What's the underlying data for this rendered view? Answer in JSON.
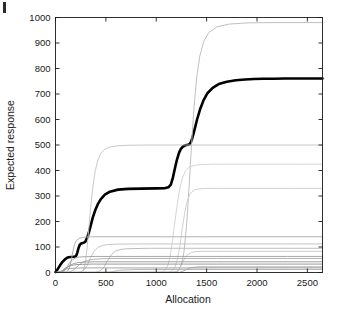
{
  "chart_data": {
    "type": "line",
    "title": "",
    "xlabel": "Allocation",
    "ylabel": "Expected response",
    "xlim": [
      0,
      2650
    ],
    "ylim": [
      0,
      1000
    ],
    "xticks": [
      0,
      500,
      1000,
      1500,
      2000,
      2500
    ],
    "yticks": [
      0,
      100,
      200,
      300,
      400,
      500,
      600,
      700,
      800,
      900,
      1000
    ],
    "xtick_labels": [
      "0",
      "500",
      "1000",
      "1500",
      "2000",
      "2500"
    ],
    "ytick_labels": [
      "0",
      "100",
      "200",
      "300",
      "400",
      "500",
      "600",
      "700",
      "800",
      "900",
      "1000"
    ],
    "grid": false,
    "legend": null,
    "series": [
      {
        "name": "total-expected-response",
        "emphasis": "thick-black",
        "color": "#000000",
        "width": 2.6,
        "plateaus": [
          60,
          115,
          330,
          500,
          760
        ],
        "x": [
          0,
          20,
          45,
          70,
          95,
          115,
          130,
          150,
          175,
          195,
          205,
          215,
          228,
          240,
          255,
          268,
          280,
          295,
          310,
          330,
          350,
          370,
          395,
          420,
          450,
          490,
          540,
          620,
          720,
          850,
          1000,
          1090,
          1120,
          1145,
          1165,
          1185,
          1205,
          1225,
          1245,
          1265,
          1285,
          1300,
          1315,
          1330,
          1345,
          1360,
          1380,
          1405,
          1435,
          1470,
          1510,
          1560,
          1620,
          1700,
          1790,
          1880,
          1970,
          2060,
          2160,
          2280,
          2420,
          2560,
          2650
        ],
        "y": [
          2,
          12,
          28,
          42,
          52,
          58,
          60,
          61,
          62,
          63,
          66,
          76,
          95,
          108,
          114,
          116,
          117,
          120,
          132,
          155,
          185,
          215,
          245,
          268,
          288,
          305,
          317,
          325,
          328,
          329,
          330,
          331,
          334,
          345,
          372,
          408,
          442,
          468,
          485,
          494,
          498,
          500,
          501,
          503,
          512,
          530,
          560,
          600,
          640,
          676,
          704,
          724,
          739,
          748,
          754,
          757,
          759,
          760,
          760,
          761,
          761,
          761,
          761
        ]
      },
      {
        "name": "component-980",
        "color": "#b8b8b8",
        "width": 0.9,
        "plateau": 980,
        "x": [
          0,
          1180,
          1215,
          1245,
          1275,
          1300,
          1325,
          1350,
          1375,
          1400,
          1430,
          1470,
          1520,
          1600,
          1720,
          1900,
          2150,
          2400,
          2650
        ],
        "y": [
          0,
          1,
          5,
          25,
          80,
          180,
          330,
          500,
          650,
          760,
          845,
          905,
          940,
          963,
          974,
          979,
          980,
          980,
          980
        ]
      },
      {
        "name": "component-500",
        "color": "#c2c2c2",
        "width": 0.9,
        "plateau": 500,
        "x": [
          0,
          250,
          275,
          295,
          312,
          330,
          350,
          372,
          395,
          420,
          450,
          490,
          545,
          620,
          730,
          900,
          1150,
          1500,
          1900,
          2300,
          2650
        ],
        "y": [
          0,
          1,
          8,
          35,
          90,
          170,
          260,
          340,
          400,
          440,
          467,
          484,
          493,
          497,
          499,
          500,
          500,
          500,
          500,
          500,
          500
        ]
      },
      {
        "name": "component-425",
        "color": "#d0d0d0",
        "width": 0.9,
        "plateau": 425,
        "x": [
          0,
          1040,
          1080,
          1110,
          1135,
          1158,
          1180,
          1205,
          1230,
          1258,
          1290,
          1330,
          1390,
          1470,
          1600,
          1800,
          2100,
          2400,
          2650
        ],
        "y": [
          0,
          1,
          6,
          22,
          58,
          115,
          185,
          258,
          322,
          370,
          399,
          414,
          421,
          424,
          425,
          425,
          425,
          425,
          425
        ]
      },
      {
        "name": "component-330",
        "color": "#cccccc",
        "width": 0.9,
        "plateau": 330,
        "x": [
          0,
          1120,
          1155,
          1185,
          1210,
          1235,
          1258,
          1282,
          1308,
          1338,
          1375,
          1425,
          1500,
          1620,
          1800,
          2050,
          2350,
          2650
        ],
        "y": [
          0,
          1,
          5,
          20,
          52,
          105,
          172,
          234,
          282,
          310,
          323,
          328,
          330,
          330,
          330,
          330,
          330,
          330
        ]
      },
      {
        "name": "component-140",
        "color": "#a8a8a8",
        "width": 0.9,
        "plateau": 140,
        "x": [
          0,
          110,
          135,
          155,
          172,
          190,
          210,
          235,
          265,
          305,
          360,
          440,
          560,
          760,
          1050,
          1450,
          1950,
          2650
        ],
        "y": [
          0,
          2,
          14,
          44,
          82,
          111,
          126,
          134,
          137,
          139,
          140,
          140,
          140,
          140,
          140,
          140,
          140,
          140
        ]
      },
      {
        "name": "component-112",
        "color": "#bdbdbd",
        "width": 0.9,
        "plateau": 112,
        "x": [
          0,
          240,
          280,
          315,
          348,
          382,
          420,
          465,
          525,
          615,
          760,
          990,
          1350,
          1800,
          2300,
          2650
        ],
        "y": [
          0,
          1,
          8,
          28,
          58,
          83,
          98,
          106,
          110,
          111,
          112,
          112,
          112,
          112,
          112,
          112
        ]
      },
      {
        "name": "component-95",
        "color": "#b5b5b5",
        "width": 0.9,
        "plateau": 95,
        "x": [
          0,
          400,
          445,
          485,
          520,
          555,
          595,
          640,
          700,
          790,
          930,
          1160,
          1500,
          1950,
          2400,
          2650
        ],
        "y": [
          0,
          1,
          7,
          24,
          48,
          70,
          84,
          90,
          93,
          94,
          95,
          95,
          95,
          95,
          95,
          95
        ]
      },
      {
        "name": "component-83",
        "color": "#c4c4c4",
        "width": 0.9,
        "plateau": 83,
        "x": [
          0,
          1170,
          1205,
          1235,
          1262,
          1290,
          1318,
          1350,
          1390,
          1445,
          1530,
          1680,
          1920,
          2250,
          2650
        ],
        "y": [
          0,
          1,
          5,
          18,
          40,
          60,
          72,
          79,
          82,
          83,
          83,
          83,
          83,
          83,
          83
        ]
      },
      {
        "name": "component-63",
        "color": "#9e9e9e",
        "width": 0.9,
        "plateau": 63,
        "x": [
          0,
          70,
          95,
          118,
          142,
          168,
          198,
          240,
          300,
          400,
          560,
          820,
          1250,
          1800,
          2300,
          2650
        ],
        "y": [
          0,
          2,
          10,
          24,
          39,
          50,
          57,
          61,
          62,
          63,
          63,
          63,
          63,
          63,
          63,
          63
        ]
      },
      {
        "name": "component-55",
        "color": "#aaaaaa",
        "width": 0.9,
        "plateau": 55,
        "x": [
          0,
          130,
          165,
          200,
          235,
          275,
          320,
          380,
          465,
          600,
          820,
          1150,
          1600,
          2100,
          2650
        ],
        "y": [
          0,
          1,
          6,
          17,
          30,
          41,
          48,
          52,
          54,
          55,
          55,
          55,
          55,
          55,
          55
        ]
      },
      {
        "name": "component-42",
        "color": "#959595",
        "width": 0.9,
        "plateau": 42,
        "x": [
          0,
          60,
          88,
          115,
          145,
          180,
          225,
          290,
          390,
          550,
          800,
          1200,
          1700,
          2250,
          2650
        ],
        "y": [
          0,
          2,
          9,
          19,
          28,
          35,
          39,
          41,
          42,
          42,
          42,
          42,
          42,
          42,
          42
        ]
      },
      {
        "name": "component-33",
        "color": "#8f8f8f",
        "width": 0.9,
        "plateau": 33,
        "x": [
          0,
          45,
          70,
          95,
          125,
          160,
          205,
          270,
          370,
          530,
          790,
          1200,
          1750,
          2300,
          2650
        ],
        "y": [
          0,
          2,
          8,
          16,
          23,
          28,
          31,
          32,
          33,
          33,
          33,
          33,
          33,
          33,
          33
        ]
      },
      {
        "name": "component-22-late",
        "color": "#a0a0a0",
        "width": 0.9,
        "plateau": 22,
        "x": [
          0,
          1230,
          1262,
          1290,
          1318,
          1348,
          1385,
          1435,
          1520,
          1680,
          1950,
          2300,
          2650
        ],
        "y": [
          0,
          1,
          4,
          10,
          16,
          19,
          21,
          22,
          22,
          22,
          22,
          22,
          22
        ]
      },
      {
        "name": "component-18",
        "color": "#999999",
        "width": 0.9,
        "plateau": 18,
        "x": [
          0,
          35,
          58,
          82,
          110,
          145,
          192,
          262,
          370,
          540,
          820,
          1250,
          1800,
          2650
        ],
        "y": [
          0,
          1,
          5,
          10,
          14,
          16,
          17,
          18,
          18,
          18,
          18,
          18,
          18,
          18
        ]
      },
      {
        "name": "component-12-mid",
        "color": "#adadad",
        "width": 0.9,
        "plateau": 12,
        "x": [
          0,
          520,
          560,
          598,
          638,
          685,
          745,
          830,
          960,
          1180,
          1520,
          2000,
          2650
        ],
        "y": [
          0,
          1,
          3,
          6,
          9,
          10,
          11,
          12,
          12,
          12,
          12,
          12,
          12
        ]
      }
    ]
  },
  "axes": {
    "y_label": "Expected response",
    "x_label": "Allocation"
  }
}
